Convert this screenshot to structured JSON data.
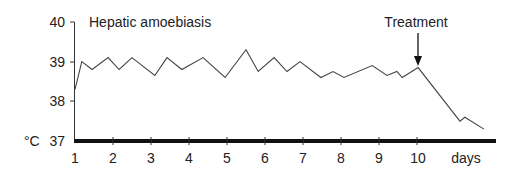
{
  "chart_data": {
    "type": "line",
    "title": "Hepatic amoebiasis",
    "xlabel": "days",
    "ylabel": "°C",
    "xlim": [
      1,
      12.1
    ],
    "ylim": [
      37,
      40
    ],
    "x_ticks": [
      "1",
      "2",
      "3",
      "4",
      "5",
      "6",
      "7",
      "8",
      "9",
      "10"
    ],
    "y_ticks": [
      "37",
      "38",
      "39",
      "40"
    ],
    "grid": false,
    "legend": null,
    "annotations": [
      {
        "text": "Treatment",
        "x": 10,
        "arrow": true
      }
    ],
    "series": [
      {
        "name": "Temperature",
        "x": [
          1.0,
          1.18,
          1.45,
          1.87,
          2.16,
          2.5,
          3.1,
          3.42,
          3.81,
          4.37,
          4.95,
          5.5,
          5.82,
          6.24,
          6.58,
          6.92,
          7.47,
          7.79,
          8.08,
          8.82,
          9.21,
          9.47,
          9.61,
          10.03,
          11.13,
          11.26,
          11.76
        ],
        "y": [
          38.3,
          39.0,
          38.8,
          39.1,
          38.8,
          39.1,
          38.65,
          39.1,
          38.8,
          39.1,
          38.6,
          39.3,
          38.75,
          39.1,
          38.75,
          39.0,
          38.6,
          38.75,
          38.6,
          38.9,
          38.65,
          38.75,
          38.6,
          38.85,
          37.5,
          37.6,
          37.3
        ]
      }
    ]
  },
  "labels": {
    "title": "Hepatic amoebiasis",
    "treatment": "Treatment",
    "unit": "°C",
    "xunit": "days",
    "y40": "40",
    "y39": "39",
    "y38": "38",
    "y37": "37",
    "x1": "1",
    "x2": "2",
    "x3": "3",
    "x4": "4",
    "x5": "5",
    "x6": "6",
    "x7": "7",
    "x8": "8",
    "x9": "9",
    "x10": "10"
  }
}
